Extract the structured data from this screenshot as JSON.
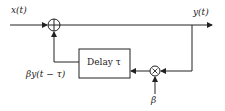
{
  "diagram": {
    "type": "block-diagram",
    "title": "",
    "nodes": {
      "input_label": "x(t)",
      "output_label": "y(t)",
      "adder_symbol": "+",
      "delay_block": "Delay τ",
      "multiplier_symbol": "×",
      "gain_label": "β",
      "feedback_label": "βy(t − τ)"
    },
    "edges": [
      {
        "from": "x(t)",
        "to": "adder"
      },
      {
        "from": "adder",
        "to": "y(t)"
      },
      {
        "from": "y(t)",
        "to": "multiplier"
      },
      {
        "from": "β",
        "to": "multiplier"
      },
      {
        "from": "multiplier",
        "to": "delay"
      },
      {
        "from": "delay",
        "to": "adder",
        "label": "βy(t − τ)"
      }
    ],
    "colors": {
      "stroke": "#222222",
      "background": "#ffffff"
    }
  }
}
